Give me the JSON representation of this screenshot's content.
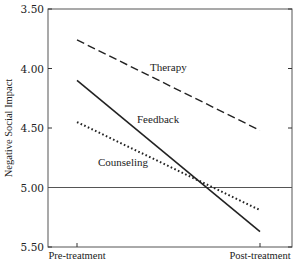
{
  "chart_data": {
    "type": "line",
    "title": "",
    "xlabel": "",
    "ylabel": "Negative Social Impact",
    "categories": [
      "Pre-treatment",
      "Post-treatment"
    ],
    "ylim": [
      3.5,
      5.5
    ],
    "y_inverted": true,
    "yticks": [
      "3.50",
      "4.00",
      "4.50",
      "5.00",
      "5.50"
    ],
    "reference_line": 5.0,
    "grid": false,
    "legend": "inline labels",
    "series": [
      {
        "name": "Therapy",
        "style": "dashed",
        "values": [
          3.76,
          4.52
        ]
      },
      {
        "name": "Feedback",
        "style": "solid",
        "values": [
          4.1,
          5.37
        ]
      },
      {
        "name": "Counseling",
        "style": "dotted",
        "values": [
          4.45,
          5.19
        ]
      }
    ]
  }
}
